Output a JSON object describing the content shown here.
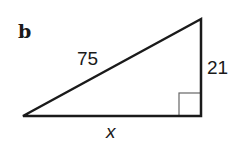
{
  "figure": {
    "part_label": "b",
    "triangle": {
      "type": "right-triangle",
      "hypotenuse_label": "75",
      "vertical_leg_label": "21",
      "horizontal_leg_label": "x",
      "right_angle_position": "bottom-right",
      "vertices": {
        "left": [
          23,
          116
        ],
        "top_right": [
          201,
          19
        ],
        "bottom_right": [
          201,
          116
        ]
      },
      "stroke_color": "#1a1a1a",
      "right_angle_marker_color": "#555555"
    }
  }
}
